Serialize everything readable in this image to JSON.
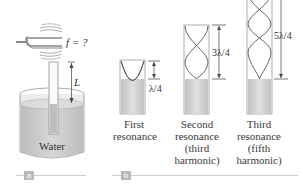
{
  "figure": {
    "panel_a": {
      "tag": "a",
      "frequency_label": "f = ?",
      "length_label": "L",
      "water_label": "Water"
    },
    "panel_b": {
      "tag": "b",
      "tubes": [
        {
          "length_label": "λ/4",
          "caption_lines": [
            "First",
            "resonance"
          ]
        },
        {
          "length_label": "3λ/4",
          "caption_lines": [
            "Second",
            "resonance",
            "(third",
            "harmonic)"
          ]
        },
        {
          "length_label": "5λ/4",
          "caption_lines": [
            "Third",
            "resonance",
            "(fifth",
            "harmonic)"
          ]
        }
      ]
    },
    "colors": {
      "water": "#c9c9c9",
      "tube_outline": "#9a9a9a",
      "wave": "#555555",
      "panel_tag": "#b9b9b9"
    }
  }
}
